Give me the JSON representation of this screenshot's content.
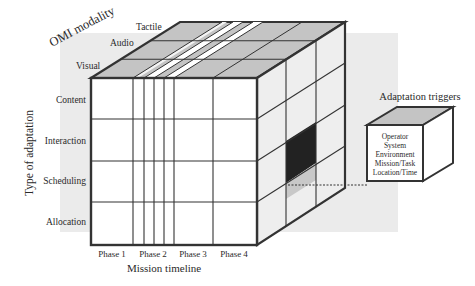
{
  "diagram": {
    "axis_modality": {
      "title": "OMI modality",
      "items": [
        "Tactile",
        "Audio",
        "Visual"
      ]
    },
    "axis_adaptation": {
      "title": "Type of adaptation",
      "items": [
        "Content",
        "Interaction",
        "Scheduling",
        "Allocation"
      ]
    },
    "axis_timeline": {
      "title": "Mission timeline",
      "items": [
        "Phase 1",
        "Phase 2",
        "Phase 3",
        "Phase 4"
      ]
    },
    "triggers": {
      "title": "Adaptation triggers",
      "items": [
        "Operator",
        "System",
        "Environment",
        "Mission/Task",
        "Location/Time"
      ]
    },
    "colors": {
      "panel": "#ebebeb",
      "top_face": "#c4c4c4",
      "side_face": "#eeeeee",
      "front_face": "#ffffff",
      "highlight_dark": "#222222",
      "highlight_light": "#c8c8c8",
      "stroke": "#333333"
    }
  }
}
